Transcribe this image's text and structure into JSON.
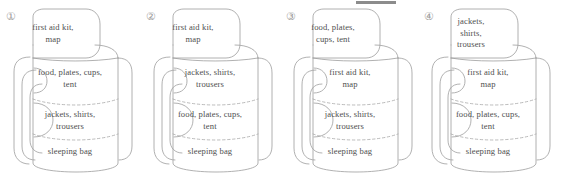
{
  "figure": {
    "panel_width": 140,
    "panel_count": 4,
    "line_color": "#9d9d9d",
    "dash_color": "#a9a9a9",
    "text_color": "#4f4f4f",
    "number_color": "#9a9a9a",
    "rule_color": "#8c8c8c",
    "background": "#ffffff"
  },
  "panels": [
    {
      "number": "①",
      "flap": "first aid kit,\nmap",
      "compartments": [
        "food, plates, cups,\ntent",
        "jackets, shirts,\ntrousers",
        "sleeping bag"
      ]
    },
    {
      "number": "②",
      "flap": "first aid kit,\nmap",
      "compartments": [
        "jackets, shirts,\ntrousers",
        "food, plates, cups,\ntent",
        "sleeping bag"
      ]
    },
    {
      "number": "③",
      "flap": "food, plates,\ncups, tent",
      "compartments": [
        "first aid kit,\nmap",
        "jackets, shirts,\ntrousers",
        "sleeping bag"
      ]
    },
    {
      "number": "④",
      "flap": "jackets,\nshirts,\ntrousers",
      "compartments": [
        "first aid kit,\nmap",
        "food, plates, cups,\ntent",
        "sleeping bag"
      ]
    }
  ]
}
